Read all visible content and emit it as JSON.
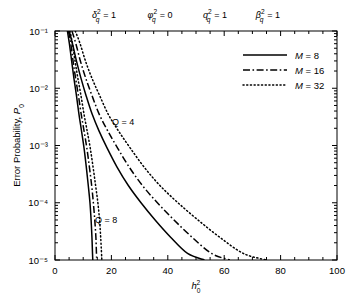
{
  "chart_data": {
    "type": "line",
    "title": "",
    "xlabel": "h_0^2",
    "xlabel_base": "h",
    "xlabel_sub": "0",
    "xlabel_sup": "2",
    "ylabel": "Error Probability, P_0",
    "ylabel_text": "Error Probability, ",
    "ylabel_var": "P",
    "ylabel_var_sub": "0",
    "xlim": [
      0,
      100
    ],
    "ylim": [
      1e-05,
      0.1
    ],
    "yscale": "log",
    "xscale": "linear",
    "grid": false,
    "xticks": [
      0,
      20,
      40,
      60,
      80,
      100
    ],
    "xticklabels": [
      "0",
      "20",
      "40",
      "60",
      "80",
      "100"
    ],
    "yticks": [
      0.1,
      0.01,
      0.001,
      0.0001,
      1e-05
    ],
    "yticklabels": [
      "10⁻¹",
      "10⁻²",
      "10⁻³",
      "10⁻⁴",
      "10⁻⁵"
    ],
    "minor_ticks": true,
    "legend": {
      "position": "upper-right-inside",
      "entries": [
        {
          "label": "M = 8",
          "style": "solid",
          "name": "legend-m8"
        },
        {
          "label": "M = 16",
          "style": "dashdot",
          "name": "legend-m16"
        },
        {
          "label": "M = 32",
          "style": "dotted",
          "name": "legend-m32"
        }
      ]
    },
    "top_annotations": [
      {
        "base": "δ",
        "sup": "2",
        "sub": "q",
        "eq": "= 1",
        "x_px": 104
      },
      {
        "base": "φ",
        "sup": "2",
        "sub": "q",
        "eq": "= 0",
        "x_px": 160
      },
      {
        "base": "q",
        "sup": "2",
        "sub": "q",
        "eq": "= 1",
        "x_px": 215
      },
      {
        "base": "β",
        "sup": "2",
        "sub": "q",
        "eq": "= 1",
        "x_px": 268
      }
    ],
    "inline_annotations": [
      {
        "text": "Q = 4",
        "x_px": 112,
        "y_px": 125,
        "name": "annotation-q4"
      },
      {
        "text": "Q = 8",
        "x_px": 95,
        "y_px": 223,
        "name": "annotation-q8"
      }
    ],
    "series": [
      {
        "name": "Q=4, M=8",
        "group": "Q = 4",
        "M": 8,
        "style": "solid",
        "points": [
          [
            5.0,
            0.1
          ],
          [
            6.2,
            0.06
          ],
          [
            7.6,
            0.03
          ],
          [
            9.2,
            0.015
          ],
          [
            11.0,
            0.0075
          ],
          [
            13.2,
            0.0035
          ],
          [
            15.6,
            0.0018
          ],
          [
            18.5,
            0.0009
          ],
          [
            22.0,
            0.00042
          ],
          [
            26.0,
            0.0002
          ],
          [
            30.5,
            0.0001
          ],
          [
            35.5,
            5e-05
          ],
          [
            41.0,
            2.5e-05
          ],
          [
            47.0,
            1.3e-05
          ],
          [
            53.0,
            1e-05
          ]
        ]
      },
      {
        "name": "Q=4, M=16",
        "group": "Q = 4",
        "M": 16,
        "style": "dashdot",
        "points": [
          [
            6.0,
            0.1
          ],
          [
            7.4,
            0.06
          ],
          [
            9.0,
            0.03
          ],
          [
            10.9,
            0.015
          ],
          [
            13.1,
            0.0075
          ],
          [
            15.7,
            0.0035
          ],
          [
            18.7,
            0.0018
          ],
          [
            22.2,
            0.0009
          ],
          [
            26.3,
            0.00042
          ],
          [
            31.0,
            0.0002
          ],
          [
            36.3,
            0.0001
          ],
          [
            42.2,
            5e-05
          ],
          [
            48.6,
            2.5e-05
          ],
          [
            55.5,
            1.3e-05
          ],
          [
            62.0,
            1e-05
          ]
        ]
      },
      {
        "name": "Q=4, M=32",
        "group": "Q = 4",
        "M": 32,
        "style": "dotted",
        "points": [
          [
            7.2,
            0.1
          ],
          [
            8.9,
            0.06
          ],
          [
            10.8,
            0.03
          ],
          [
            13.1,
            0.015
          ],
          [
            15.8,
            0.0075
          ],
          [
            18.9,
            0.0035
          ],
          [
            22.5,
            0.0018
          ],
          [
            26.7,
            0.0009
          ],
          [
            31.6,
            0.00042
          ],
          [
            37.2,
            0.0002
          ],
          [
            43.6,
            0.0001
          ],
          [
            50.7,
            5e-05
          ],
          [
            58.4,
            2.5e-05
          ],
          [
            66.8,
            1.3e-05
          ],
          [
            75.0,
            1e-05
          ]
        ]
      },
      {
        "name": "Q=8, M=8",
        "group": "Q = 8",
        "M": 8,
        "style": "solid",
        "points": [
          [
            4.4,
            0.1
          ],
          [
            5.1,
            0.06
          ],
          [
            5.9,
            0.03
          ],
          [
            6.7,
            0.015
          ],
          [
            7.6,
            0.0075
          ],
          [
            8.5,
            0.0035
          ],
          [
            9.4,
            0.0018
          ],
          [
            10.3,
            0.0009
          ],
          [
            11.1,
            0.00042
          ],
          [
            11.8,
            0.0002
          ],
          [
            12.4,
            0.0001
          ],
          [
            12.8,
            5e-05
          ],
          [
            13.1,
            2.5e-05
          ],
          [
            13.3,
            1.3e-05
          ],
          [
            13.4,
            1e-05
          ]
        ]
      },
      {
        "name": "Q=8, M=16",
        "group": "Q = 8",
        "M": 16,
        "style": "dashdot",
        "points": [
          [
            4.8,
            0.1
          ],
          [
            5.6,
            0.06
          ],
          [
            6.4,
            0.03
          ],
          [
            7.3,
            0.015
          ],
          [
            8.3,
            0.0075
          ],
          [
            9.3,
            0.0035
          ],
          [
            10.3,
            0.0018
          ],
          [
            11.3,
            0.0009
          ],
          [
            12.2,
            0.00042
          ],
          [
            13.0,
            0.0002
          ],
          [
            13.6,
            0.0001
          ],
          [
            14.1,
            5e-05
          ],
          [
            14.5,
            2.5e-05
          ],
          [
            14.7,
            1.3e-05
          ],
          [
            14.8,
            1e-05
          ]
        ]
      },
      {
        "name": "Q=8, M=32",
        "group": "Q = 8",
        "M": 32,
        "style": "dotted",
        "points": [
          [
            5.3,
            0.1
          ],
          [
            6.2,
            0.06
          ],
          [
            7.1,
            0.03
          ],
          [
            8.1,
            0.015
          ],
          [
            9.2,
            0.0075
          ],
          [
            10.3,
            0.0035
          ],
          [
            11.4,
            0.0018
          ],
          [
            12.5,
            0.0009
          ],
          [
            13.5,
            0.00042
          ],
          [
            14.4,
            0.0002
          ],
          [
            15.2,
            0.0001
          ],
          [
            15.8,
            5e-05
          ],
          [
            16.2,
            2.5e-05
          ],
          [
            16.5,
            1.3e-05
          ],
          [
            16.6,
            1e-05
          ]
        ]
      }
    ]
  }
}
